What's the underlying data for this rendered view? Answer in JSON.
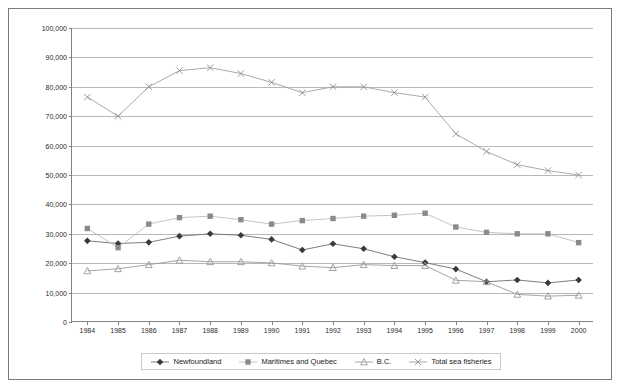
{
  "chart_data": {
    "type": "line",
    "title": "",
    "subtitle": "",
    "xlabel": "",
    "ylabel": "",
    "grid": true,
    "legend_position": "bottom",
    "xlim": [
      1984,
      2000
    ],
    "ylim": [
      0,
      100000
    ],
    "ytick_step": 10000,
    "categories": [
      1984,
      1985,
      1986,
      1987,
      1988,
      1989,
      1990,
      1991,
      1992,
      1993,
      1994,
      1995,
      1996,
      1997,
      1998,
      1999,
      2000
    ],
    "x_tick_labels": [
      "1984",
      "1985",
      "1986",
      "1987",
      "1988",
      "1989",
      "1990",
      "1991",
      "1992",
      "1993",
      "1994",
      "1995",
      "1996",
      "1997",
      "1998",
      "1999",
      "2000"
    ],
    "y_tick_labels": [
      "0",
      "10,000",
      "20,000",
      "30,000",
      "40,000",
      "50,000",
      "60,000",
      "70,000",
      "80,000",
      "90,000",
      "100,000"
    ],
    "y_tick_values": [
      0,
      10000,
      20000,
      30000,
      40000,
      50000,
      60000,
      70000,
      80000,
      90000,
      100000
    ],
    "series": [
      {
        "name": "Newfoundland",
        "marker": "diamond",
        "color": "#3a3a3a",
        "line_color": "#6e6e6e",
        "values": [
          27600,
          26700,
          27100,
          29200,
          30000,
          29500,
          28100,
          24500,
          26600,
          24900,
          22200,
          20200,
          18000,
          13700,
          14300,
          13300,
          14300
        ]
      },
      {
        "name": "Maritimes and Quebec",
        "marker": "square",
        "color": "#8a8a8a",
        "line_color": "#bdbdbd",
        "values": [
          31800,
          25300,
          33300,
          35500,
          36000,
          34800,
          33300,
          34500,
          35200,
          36000,
          36300,
          37000,
          32300,
          30500,
          30000,
          30000,
          27000
        ]
      },
      {
        "name": "B.C.",
        "marker": "triangle",
        "color": "#9a9a9a",
        "line_color": "#9a9a9a",
        "values": [
          17400,
          18100,
          19500,
          21000,
          20500,
          20500,
          20100,
          19000,
          18500,
          19500,
          19200,
          19200,
          14200,
          13700,
          9400,
          8800,
          9100
        ]
      },
      {
        "name": "Total sea fisheries",
        "marker": "cross",
        "color": "#8f8f8f",
        "line_color": "#a0a0a0",
        "values": [
          76500,
          70000,
          80000,
          85500,
          86500,
          84500,
          81500,
          78000,
          80000,
          80000,
          78000,
          76500,
          64000,
          58000,
          53500,
          51500,
          50000
        ]
      }
    ]
  },
  "legend": {
    "items": [
      {
        "label": "Newfoundland",
        "marker": "diamond-marker"
      },
      {
        "label": "Maritimes and Quebec",
        "marker": "square-marker"
      },
      {
        "label": "B.C.",
        "marker": "triangle-marker"
      },
      {
        "label": "Total sea fisheries",
        "marker": "cross-marker"
      }
    ]
  }
}
